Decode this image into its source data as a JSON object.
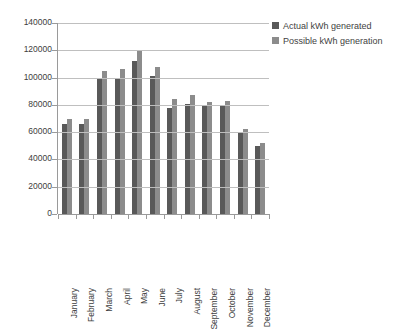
{
  "chart_data": {
    "type": "bar",
    "title": "",
    "xlabel": "",
    "ylabel": "",
    "ylim": [
      0,
      140000
    ],
    "ytick_step": 20000,
    "yticks": [
      "140000",
      "120000",
      "100000",
      "80000",
      "60000",
      "40000",
      "20000",
      "0"
    ],
    "grid": true,
    "legend_position": "top-right",
    "categories": [
      "January",
      "February",
      "March",
      "April",
      "May",
      "June",
      "July",
      "August",
      "September",
      "October",
      "November",
      "December"
    ],
    "series": [
      {
        "name": "Actual kWh generated",
        "color": "#595959",
        "values": [
          66000,
          66000,
          99000,
          100000,
          112000,
          101000,
          78000,
          81000,
          80000,
          80000,
          60000,
          50000
        ]
      },
      {
        "name": "Possible kWh generation",
        "color": "#8c8c8c",
        "values": [
          70000,
          70000,
          105000,
          106000,
          120000,
          108000,
          84000,
          87000,
          82000,
          83000,
          62000,
          52000
        ]
      }
    ]
  },
  "legend": {
    "items": [
      {
        "label": "Actual kWh generated"
      },
      {
        "label": "Possible kWh generation"
      }
    ]
  },
  "colors": {
    "actual": "#595959",
    "possible": "#8c8c8c",
    "gridline": "#bfbfbf",
    "axis": "#9a9a9a",
    "text": "#3f3f3f",
    "background": "#ffffff"
  }
}
